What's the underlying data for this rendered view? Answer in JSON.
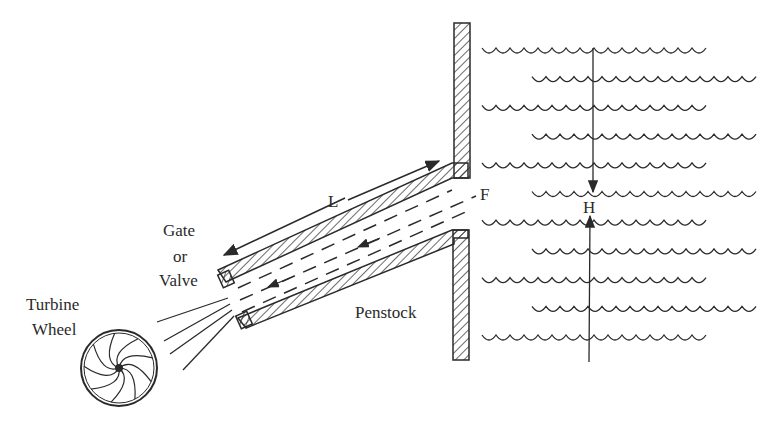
{
  "diagram": {
    "type": "hydropower penstock schematic",
    "labels": {
      "gate_line1": "Gate",
      "gate_line2": "or",
      "gate_line3": "Valve",
      "turbine_line1": "Turbine",
      "turbine_line2": "Wheel",
      "length": "L",
      "forebay": "F",
      "head": "H",
      "penstock": "Penstock"
    },
    "colors": {
      "ink": "#2a2a2a",
      "background": "#ffffff"
    },
    "reservoir_wave_rows": 11
  }
}
